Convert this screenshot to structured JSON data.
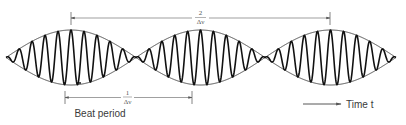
{
  "diagram": {
    "colors": {
      "wave": "#111111",
      "envelope": "#333333",
      "arrows": "#666666",
      "text": "#3a3a3a"
    },
    "waveform": {
      "center_y": 57.5,
      "amplitude": 27.5,
      "x_start": 6,
      "x_end": 396,
      "beat_half_period_px": 129.3,
      "envelope_nodes_x": [
        6,
        136,
        265,
        396
      ],
      "envelope_peaks_x": [
        71,
        200,
        330
      ],
      "carrier_cycles_per_beat": 10
    },
    "annotations": {
      "top_arrow": {
        "x1": 71,
        "x2": 330,
        "y": 18,
        "numerator": "2",
        "denominator": "Δν"
      },
      "bottom_arrow": {
        "x1": 65,
        "x2": 192,
        "y": 97,
        "numerator": "1",
        "denominator": "Δν"
      },
      "beat_period_label": "Beat period",
      "time_axis": {
        "arrow_x1": 303,
        "arrow_x2": 342,
        "y": 104,
        "label": "Time t"
      }
    }
  }
}
